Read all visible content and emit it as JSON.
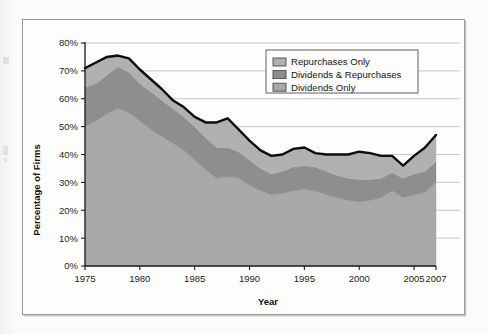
{
  "figure": {
    "background_color": "#fdfdfc",
    "frame_color": "#9a9a98"
  },
  "legend": {
    "position": "top-right-inside",
    "border_color": "#6e6e6e",
    "entries": [
      {
        "label": "Repurchases Only",
        "color": "#b0b0b0"
      },
      {
        "label": "Dividends & Repurchases",
        "color": "#8e8e8e"
      },
      {
        "label": "Dividends Only",
        "color": "#a8a8a8"
      }
    ]
  },
  "chart_data": {
    "type": "area",
    "stacked": true,
    "title": "",
    "xlabel": "Year",
    "ylabel": "Percentage of Firms",
    "xlim": [
      1975,
      2007
    ],
    "ylim": [
      0,
      80
    ],
    "grid": "horizontal",
    "ytick_labels": [
      "0%",
      "10%",
      "20%",
      "30%",
      "40%",
      "50%",
      "60%",
      "70%",
      "80%"
    ],
    "ytick_values": [
      0,
      10,
      20,
      30,
      40,
      50,
      60,
      70,
      80
    ],
    "xtick_labels": [
      "1975",
      "1980",
      "1985",
      "1990",
      "1995",
      "2000",
      "2005",
      "2007"
    ],
    "xtick_values": [
      1975,
      1980,
      1985,
      1990,
      1995,
      2000,
      2005,
      2007
    ],
    "x": [
      1975,
      1976,
      1977,
      1978,
      1979,
      1980,
      1981,
      1982,
      1983,
      1984,
      1985,
      1986,
      1987,
      1988,
      1989,
      1990,
      1991,
      1992,
      1993,
      1994,
      1995,
      1996,
      1997,
      1998,
      1999,
      2000,
      2001,
      2002,
      2003,
      2004,
      2005,
      2006,
      2007
    ],
    "series": [
      {
        "name": "Dividends Only",
        "color": "#a8a8a8",
        "values": [
          50.0,
          52.0,
          54.5,
          56.5,
          55.0,
          52.0,
          49.0,
          46.5,
          44.0,
          41.5,
          38.0,
          34.5,
          31.5,
          32.0,
          31.5,
          29.0,
          27.0,
          25.5,
          26.0,
          27.0,
          27.5,
          27.0,
          25.5,
          24.5,
          23.5,
          23.0,
          23.5,
          24.5,
          27.0,
          24.5,
          25.5,
          26.5,
          30.0
        ]
      },
      {
        "name": "Dividends & Repurchases",
        "color": "#8e8e8e",
        "values": [
          14.0,
          13.5,
          14.0,
          15.0,
          14.5,
          13.5,
          13.5,
          13.0,
          12.5,
          12.0,
          12.0,
          11.5,
          11.0,
          10.5,
          9.5,
          9.0,
          8.0,
          7.5,
          8.0,
          8.5,
          8.5,
          8.5,
          8.5,
          8.0,
          8.0,
          8.0,
          7.5,
          7.0,
          6.5,
          7.0,
          7.5,
          7.5,
          7.5
        ]
      },
      {
        "name": "Repurchases Only",
        "color": "#b0b0b0",
        "values": [
          7.0,
          7.5,
          6.5,
          4.0,
          5.0,
          5.0,
          4.5,
          4.0,
          3.0,
          3.5,
          3.5,
          5.5,
          9.0,
          10.5,
          8.0,
          7.0,
          6.5,
          6.5,
          6.0,
          6.5,
          6.5,
          5.0,
          6.0,
          7.5,
          8.5,
          10.0,
          9.5,
          8.0,
          6.0,
          4.5,
          6.5,
          8.5,
          9.5
        ]
      }
    ],
    "total_line": {
      "name": "Total Payers",
      "color": "#0d0d0d",
      "values": [
        71.0,
        73.0,
        75.0,
        75.5,
        74.5,
        70.5,
        67.0,
        63.5,
        59.5,
        57.0,
        53.5,
        51.5,
        51.5,
        53.0,
        49.0,
        45.0,
        41.5,
        39.5,
        40.0,
        42.0,
        42.5,
        40.5,
        40.0,
        40.0,
        40.0,
        41.0,
        40.5,
        39.5,
        39.5,
        36.0,
        39.5,
        42.5,
        47.0
      ]
    }
  }
}
